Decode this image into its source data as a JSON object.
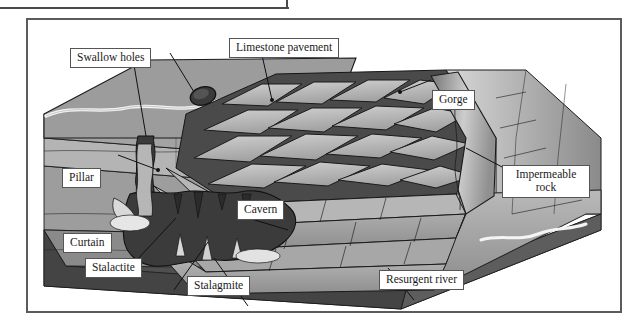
{
  "figure": {
    "type": "karst-limestone-block-diagram",
    "title": "",
    "frame": {
      "border_color": "#5b5b5b"
    },
    "palette": {
      "plateau_top": "#9a9a9a",
      "limestone_light": "#c9c9c9",
      "limestone_mid": "#a8a8a8",
      "limestone_dark": "#7e7e7e",
      "grike_dark": "#4e4e4e",
      "cavern_void": "#3c3c3c",
      "impermeable_rock": "#555555",
      "stream_white": "#f2f2f2",
      "outline": "#1a1a1a",
      "label_fill": "#ffffff",
      "label_border": "#555555"
    }
  },
  "labels": [
    {
      "id": "swallow-holes",
      "text": "Swallow holes"
    },
    {
      "id": "limestone-pavement",
      "text": "Limestone pavement"
    },
    {
      "id": "gorge",
      "text": "Gorge"
    },
    {
      "id": "impermeable-rock",
      "text": "Impermeable\nrock",
      "line1": "Impermeable",
      "line2": "rock"
    },
    {
      "id": "pillar",
      "text": "Pillar"
    },
    {
      "id": "cavern",
      "text": "Cavern"
    },
    {
      "id": "curtain",
      "text": "Curtain"
    },
    {
      "id": "stalactite",
      "text": "Stalactite"
    },
    {
      "id": "stalagmite",
      "text": "Stalagmite"
    },
    {
      "id": "resurgent-river",
      "text": "Resurgent river"
    }
  ],
  "features": {
    "swallow_holes": "dark sinkhole openings on the plateau surface where surface streams disappear underground",
    "limestone_pavement": "grid of light clint blocks separated by dark grike fissures",
    "gorge": "steep-sided valley incised into the stepped limestone",
    "impermeable_rock": "dark basal rock layer beneath the limestone",
    "cavern": "large dark underground void within the limestone",
    "pillar": "column joining stalactite and stalagmite",
    "curtain": "sheet-like flowstone deposit",
    "stalactite": "deposit hanging from cave ceiling",
    "stalagmite": "deposit rising from cave floor",
    "resurgent_river": "stream re-emerging at the base of the limestone"
  }
}
